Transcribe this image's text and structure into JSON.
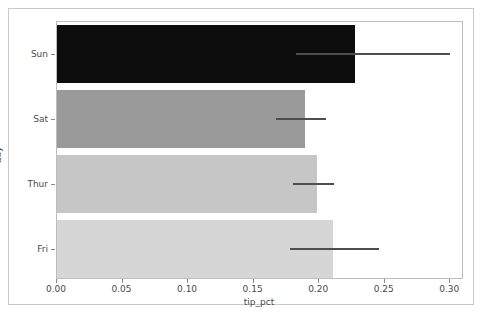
{
  "chart_data": {
    "type": "bar",
    "orientation": "horizontal",
    "title": "",
    "xlabel": "tip_pct",
    "ylabel": "day",
    "categories": [
      "Sun",
      "Sat",
      "Thur",
      "Fri"
    ],
    "values": [
      0.2273,
      0.1892,
      0.1983,
      0.2107
    ],
    "error_low": [
      0.182,
      0.167,
      0.18,
      0.178
    ],
    "error_high": [
      0.3,
      0.205,
      0.211,
      0.246
    ],
    "xlim": [
      0.0,
      0.3105
    ],
    "xticks": [
      0.0,
      0.05,
      0.1,
      0.15,
      0.2,
      0.25,
      0.3
    ],
    "xticklabels": [
      "0.00",
      "0.05",
      "0.10",
      "0.15",
      "0.20",
      "0.25",
      "0.30"
    ],
    "grid": false,
    "legend": null,
    "bar_colors": [
      "#0d0d0d",
      "#9a9a9a",
      "#c6c6c6",
      "#d6d6d6"
    ],
    "errorbar_color": "#4e4e4e"
  }
}
